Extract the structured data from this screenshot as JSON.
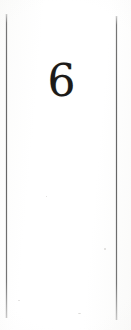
{
  "document": {
    "kind": "scanned-page-fragment",
    "background_color": "#fdfdfc",
    "page_number": "6",
    "page_number_color": "#1c1a18",
    "rules": {
      "color": "#686868",
      "left_rule_label": "",
      "right_rule_label": ""
    },
    "body_text": "",
    "header_text": "",
    "footer_text": ""
  }
}
